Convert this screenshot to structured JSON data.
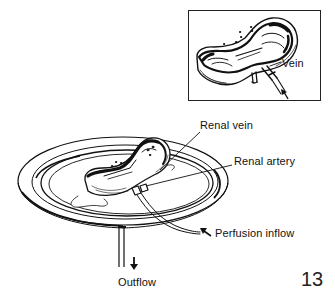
{
  "figure": {
    "inset": {
      "labels": {
        "vein": "Vein"
      }
    },
    "main": {
      "labels": {
        "renal_vein": "Renal vein",
        "renal_artery": "Renal artery",
        "perfusion_inflow": "Perfusion inflow",
        "outflow": "Outflow"
      }
    },
    "page_number": "13"
  },
  "colors": {
    "ink": "#111111",
    "background": "#ffffff"
  }
}
